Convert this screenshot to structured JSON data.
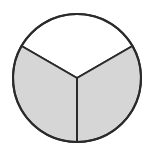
{
  "diagram": {
    "type": "fraction-circle",
    "total_parts": 3,
    "shaded_parts": 2,
    "fraction": "2/3",
    "center": [
      77,
      78
    ],
    "radius": 64,
    "colors": {
      "shaded": "#d6d6d6",
      "unshaded": "#ffffff",
      "stroke": "#2a2a2a",
      "background": "#ffffff"
    },
    "sectors": [
      {
        "name": "top",
        "start_deg": 210,
        "end_deg": 330,
        "shaded": false
      },
      {
        "name": "bottom-right",
        "start_deg": 330,
        "end_deg": 450,
        "shaded": true
      },
      {
        "name": "bottom-left",
        "start_deg": 90,
        "end_deg": 210,
        "shaded": true
      }
    ]
  }
}
